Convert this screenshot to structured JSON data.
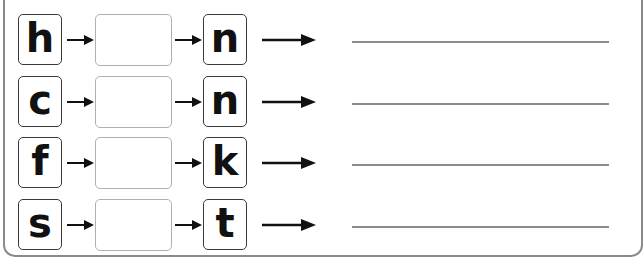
{
  "worksheet": {
    "heading_partial": "... the word",
    "rows": [
      {
        "start_letter": "h",
        "missing": "",
        "end_letter": "n",
        "answer": ""
      },
      {
        "start_letter": "c",
        "missing": "",
        "end_letter": "n",
        "answer": ""
      },
      {
        "start_letter": "f",
        "missing": "",
        "end_letter": "k",
        "answer": ""
      },
      {
        "start_letter": "s",
        "missing": "",
        "end_letter": "t",
        "answer": ""
      }
    ]
  },
  "colors": {
    "letter_box_border": "#3a3a3a",
    "blank_box_border": "#b0b0b0",
    "answer_line": "#8c8c8c",
    "frame_border": "#8a8a8a",
    "arrow": "#111111"
  }
}
